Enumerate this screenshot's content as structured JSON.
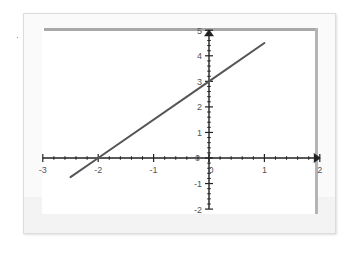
{
  "chart_data": {
    "type": "line",
    "title": "",
    "xlabel": "",
    "ylabel": "",
    "xlim": [
      -3,
      2
    ],
    "ylim": [
      -2,
      5
    ],
    "grid": false,
    "legend": null,
    "x_ticks": [
      -3,
      -2,
      -1,
      0,
      1,
      2
    ],
    "y_ticks": [
      -2,
      -1,
      0,
      1,
      2,
      3,
      4,
      5
    ],
    "x_tick_labels": [
      "-3",
      "-2",
      "-1",
      "0",
      "1",
      "2"
    ],
    "y_tick_labels": [
      "-2",
      "-1",
      "0",
      "1",
      "2",
      "3",
      "4",
      "5"
    ],
    "minor_ticks_per_unit": 5,
    "series": [
      {
        "name": "y = 1.5x + 3",
        "equation": "y = 1.5x + 3",
        "x": [
          -2.5,
          -2,
          0,
          1
        ],
        "y": [
          -0.75,
          0,
          3,
          4.5
        ],
        "color": "#555555"
      }
    ],
    "annotations": {
      "x_intercept": [
        -2,
        0
      ],
      "y_intercept": [
        0,
        3
      ]
    }
  },
  "colors": {
    "axis": "#222222",
    "line": "#555555",
    "frame_border": "#dcdcdc",
    "plot_border": "#a8a8a8",
    "label": "#555555"
  }
}
